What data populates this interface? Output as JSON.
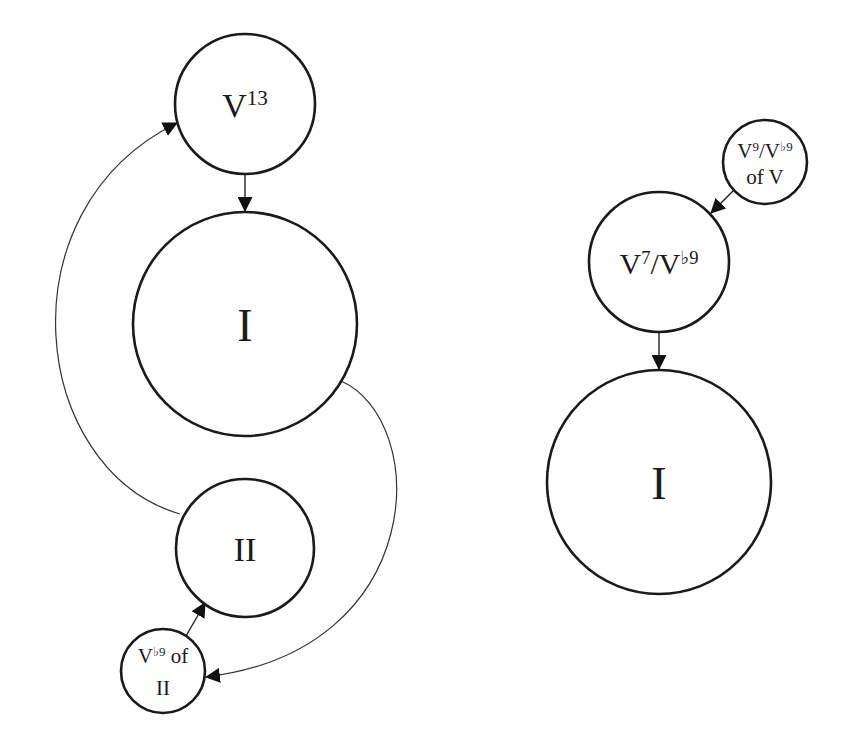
{
  "diagram": {
    "type": "harmonic-function-graph",
    "colors": {
      "stroke": "#1a1a1a",
      "background": "#ffffff",
      "text": "#1a1a1a"
    },
    "left_graph": {
      "nodes": {
        "v13": {
          "base": "V",
          "sup": "13",
          "cx": 245,
          "cy": 104,
          "r": 70
        },
        "tonic": {
          "label": "I",
          "cx": 245,
          "cy": 324,
          "r": 112
        },
        "supertonic": {
          "label": "II",
          "cx": 245,
          "cy": 548,
          "r": 69
        },
        "secondary_dom": {
          "base": "V",
          "sup": "♭9",
          "after": " of",
          "line2": "II",
          "cx": 163,
          "cy": 671,
          "r": 42
        }
      },
      "edges": [
        {
          "from": "V13",
          "to": "I",
          "style": "straight"
        },
        {
          "from": "I",
          "to": "V♭9 of II",
          "style": "curved"
        },
        {
          "from": "V♭9 of II",
          "to": "II",
          "style": "straight"
        },
        {
          "from": "II",
          "to": "V13",
          "style": "curved"
        }
      ]
    },
    "right_graph": {
      "nodes": {
        "applied_dom": {
          "base1": "V",
          "sup1": "9",
          "slash": "/",
          "base2": "V",
          "sup2": "♭9",
          "line2": "of V",
          "cx": 765,
          "cy": 162,
          "r": 42
        },
        "dominant": {
          "base1": "V",
          "sup1": "7",
          "slash": "/",
          "base2": "V",
          "sup2": "♭9",
          "cx": 659,
          "cy": 262,
          "r": 70
        },
        "tonic": {
          "label": "I",
          "cx": 659,
          "cy": 482,
          "r": 112
        }
      },
      "edges": [
        {
          "from": "V9/V♭9 of V",
          "to": "V7/V♭9",
          "style": "straight"
        },
        {
          "from": "V7/V♭9",
          "to": "I",
          "style": "straight"
        }
      ]
    }
  }
}
